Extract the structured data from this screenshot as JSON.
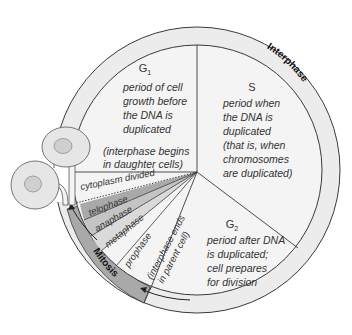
{
  "colors": {
    "ring": "#ececec",
    "interior": "#f4f4f4",
    "mitosis_band": "#a9a9a9",
    "telophase": "#a9a9a9",
    "anaphase": "#c4c4c4",
    "metaphase": "#dadada",
    "stroke": "#3a3a3a"
  },
  "ring_labels": {
    "interphase": "Interphase",
    "mitosis": "Mitosis"
  },
  "g1": {
    "letter": "G",
    "subscript": "1",
    "lines": [
      "period of cell",
      "growth before",
      "the DNA is",
      "duplicated"
    ],
    "note_lines": [
      "(interphase begins",
      "in daughter cells)"
    ]
  },
  "s": {
    "letter": "S",
    "lines": [
      "period when",
      "the DNA is",
      "duplicated",
      "(that is, when",
      "chromosomes",
      "are duplicated)"
    ]
  },
  "g2": {
    "letter": "G",
    "subscript": "2",
    "lines": [
      "period after DNA",
      "is duplicated;",
      "cell prepares",
      "for division"
    ]
  },
  "mitosis_stages": {
    "cytoplasm": "cytoplasm divided",
    "telophase": "telophase",
    "anaphase": "anaphase",
    "metaphase": "metaphase",
    "prophase": "prophase"
  },
  "interphase_end": {
    "lines": [
      "(interphase ends",
      "in parent cell)"
    ]
  },
  "daughter_cells": [
    {
      "name": "daughter-cell-upper"
    },
    {
      "name": "daughter-cell-lower"
    }
  ]
}
